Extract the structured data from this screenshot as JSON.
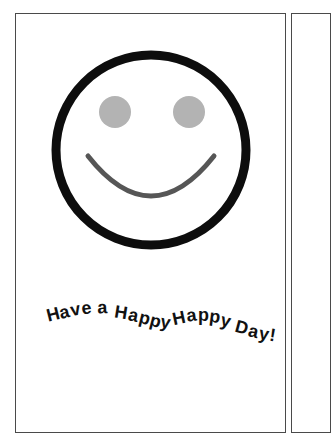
{
  "document": {
    "title": "Greeting Card Preview",
    "page_background": "#ffffff"
  },
  "card_front": {
    "name": "card-front-panel",
    "border_color": "#4a4a4a",
    "background": "#ffffff",
    "greeting_text": "Have a Happy Happy Day!",
    "greeting_text_color": "#111111",
    "greeting_layout": "wavy-arched"
  },
  "card_back": {
    "name": "card-back-panel",
    "border_color": "#4a4a4a",
    "background": "#ffffff"
  },
  "smiley": {
    "name": "smiley-face-illustration",
    "face_outline_color": "#0d0d0d",
    "face_outline_width": 9,
    "face_fill": "#ffffff",
    "eye_color": "#b3b3b3",
    "eye_radius": 16,
    "left_eye_label": "left-eye",
    "right_eye_label": "right-eye",
    "mouth_color": "#565656",
    "mouth_width": 5,
    "mouth_label": "smile-arc"
  },
  "greeting_glyphs": [
    {
      "char": "H",
      "x": 36,
      "y": 38,
      "rot": -14
    },
    {
      "char": "a",
      "x": 50,
      "y": 35,
      "rot": -13
    },
    {
      "char": "v",
      "x": 62,
      "y": 32,
      "rot": -11
    },
    {
      "char": "e",
      "x": 74,
      "y": 30,
      "rot": -8
    },
    {
      "char": " ",
      "x": 85,
      "y": 29,
      "rot": -6
    },
    {
      "char": "a",
      "x": 91,
      "y": 29,
      "rot": -2
    },
    {
      "char": " ",
      "x": 103,
      "y": 30,
      "rot": 3
    },
    {
      "char": "H",
      "x": 109,
      "y": 33,
      "rot": 9
    },
    {
      "char": "a",
      "x": 124,
      "y": 36,
      "rot": 12
    },
    {
      "char": "p",
      "x": 136,
      "y": 39,
      "rot": 14
    },
    {
      "char": "p",
      "x": 148,
      "y": 42,
      "rot": 15
    },
    {
      "char": "y",
      "x": 160,
      "y": 44,
      "rot": 11
    },
    {
      "char": " ",
      "x": 171,
      "y": 45,
      "rot": 2
    },
    {
      "char": "H",
      "x": 176,
      "y": 42,
      "rot": -12
    },
    {
      "char": "a",
      "x": 191,
      "y": 38,
      "rot": -8
    },
    {
      "char": "p",
      "x": 203,
      "y": 37,
      "rot": 0
    },
    {
      "char": "p",
      "x": 215,
      "y": 38,
      "rot": 7
    },
    {
      "char": "y",
      "x": 227,
      "y": 42,
      "rot": 14
    },
    {
      "char": " ",
      "x": 238,
      "y": 46,
      "rot": 18
    },
    {
      "char": "D",
      "x": 243,
      "y": 49,
      "rot": 15
    },
    {
      "char": "a",
      "x": 258,
      "y": 54,
      "rot": 13
    },
    {
      "char": "y",
      "x": 270,
      "y": 57,
      "rot": 11
    },
    {
      "char": "!",
      "x": 282,
      "y": 59,
      "rot": 9
    }
  ]
}
